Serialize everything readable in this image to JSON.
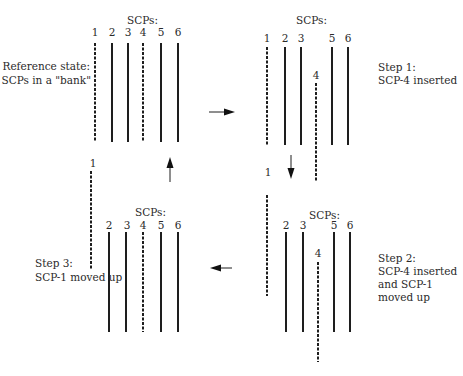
{
  "diagram": {
    "type": "process-cycle",
    "panels": {
      "reference": {
        "header": "SCPs:",
        "caption": [
          "Reference state:",
          "6 SCPs in a \"bank\""
        ],
        "scps": [
          {
            "id": "1",
            "style": "dashed"
          },
          {
            "id": "2",
            "style": "solid"
          },
          {
            "id": "3",
            "style": "solid"
          },
          {
            "id": "4",
            "style": "dashed"
          },
          {
            "id": "5",
            "style": "solid"
          },
          {
            "id": "6",
            "style": "solid"
          }
        ]
      },
      "step1": {
        "header": "SCPs:",
        "caption": [
          "Step 1:",
          "SCP-4 inserted"
        ],
        "scps": [
          {
            "id": "1",
            "style": "dashed"
          },
          {
            "id": "2",
            "style": "solid"
          },
          {
            "id": "3",
            "style": "solid"
          },
          {
            "id": "4",
            "style": "dashed",
            "state": "inserted"
          },
          {
            "id": "5",
            "style": "solid"
          },
          {
            "id": "6",
            "style": "solid"
          }
        ]
      },
      "step2": {
        "header": "SCPs:",
        "caption": [
          "Step 2:",
          "SCP-4 inserted",
          "and SCP-1",
          "moved up"
        ],
        "scps": [
          {
            "id": "1",
            "style": "dashed",
            "state": "moved-up"
          },
          {
            "id": "2",
            "style": "solid"
          },
          {
            "id": "3",
            "style": "solid"
          },
          {
            "id": "4",
            "style": "dashed",
            "state": "inserted"
          },
          {
            "id": "5",
            "style": "solid"
          },
          {
            "id": "6",
            "style": "solid"
          }
        ]
      },
      "step3": {
        "header": "SCPs:",
        "caption": [
          "Step 3:",
          "SCP-1 moved up"
        ],
        "scps": [
          {
            "id": "1",
            "style": "dashed",
            "state": "moved-up"
          },
          {
            "id": "2",
            "style": "solid"
          },
          {
            "id": "3",
            "style": "solid"
          },
          {
            "id": "4",
            "style": "dashed"
          },
          {
            "id": "5",
            "style": "solid"
          },
          {
            "id": "6",
            "style": "solid"
          }
        ]
      }
    },
    "flow": [
      {
        "from": "reference",
        "to": "step1",
        "direction": "right"
      },
      {
        "from": "step1",
        "to": "step2",
        "direction": "down"
      },
      {
        "from": "step2",
        "to": "step3",
        "direction": "left"
      },
      {
        "from": "step3",
        "to": "reference",
        "direction": "up"
      }
    ]
  }
}
